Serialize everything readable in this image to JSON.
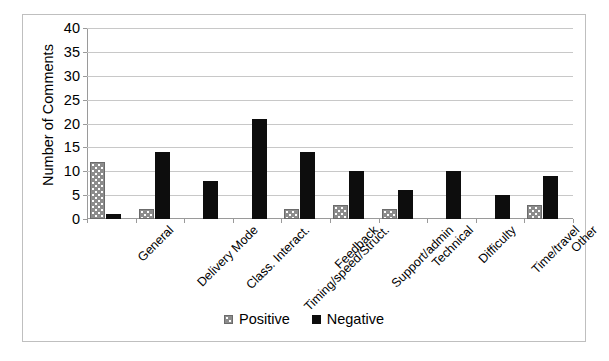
{
  "chart_data": {
    "type": "bar",
    "title": "",
    "xlabel": "",
    "ylabel": "Number of Comments",
    "ylim": [
      0,
      40
    ],
    "ytick_step": 5,
    "yticks": [
      40,
      35,
      30,
      25,
      20,
      15,
      10,
      5,
      0
    ],
    "grid": true,
    "legend_position": "bottom-center",
    "categories": [
      "General",
      "Delivery Mode",
      "Class. Interact.",
      "Timing/speed/Struct.",
      "Feedback",
      "Support/admin",
      "Technical",
      "Difficulty",
      "Time/travel",
      "Other"
    ],
    "series": [
      {
        "name": "Positive",
        "color": "#8c8c8c",
        "pattern": "dotted",
        "values": [
          12,
          2,
          0,
          0,
          2,
          3,
          2,
          0,
          0,
          3
        ]
      },
      {
        "name": "Negative",
        "color": "#0d0d0d",
        "pattern": "solid",
        "values": [
          1,
          14,
          8,
          21,
          14,
          10,
          6,
          10,
          5,
          9
        ]
      }
    ]
  },
  "legend": {
    "items": [
      {
        "label": "Positive",
        "swatch": "positive-swatch-icon"
      },
      {
        "label": "Negative",
        "swatch": "negative-swatch-icon"
      }
    ]
  }
}
